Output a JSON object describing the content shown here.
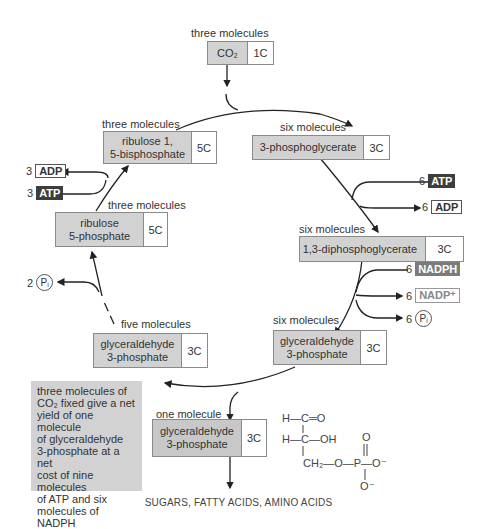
{
  "diagram": {
    "nodes": {
      "co2": {
        "count_label": "three molecules",
        "name": "CO₂",
        "carbons": "1C"
      },
      "pga": {
        "count_label": "six molecules",
        "name": "3-phosphoglycerate",
        "carbons": "3C"
      },
      "dpg": {
        "count_label": "six molecules",
        "name": "1,3-diphosphoglycerate",
        "carbons": "3C"
      },
      "g3p_six": {
        "count_label": "six molecules",
        "name_line1": "glyceraldehyde",
        "name_line2": "3-phosphate",
        "carbons": "3C"
      },
      "g3p_five": {
        "count_label": "five molecules",
        "name_line1": "glyceraldehyde",
        "name_line2": "3-phosphate",
        "carbons": "3C"
      },
      "ru5p": {
        "count_label": "three molecules",
        "name_line1": "ribulose",
        "name_line2": "5-phosphate",
        "carbons": "5C"
      },
      "rubp": {
        "count_label": "three molecules",
        "name_line1": "ribulose 1,",
        "name_line2": "5-bisphosphate",
        "carbons": "5C"
      },
      "g3p_one": {
        "count_label": "one molecule",
        "name_line1": "glyceraldehyde",
        "name_line2": "3-phosphate",
        "carbons": "3C"
      }
    },
    "cofactors": {
      "atp_in_right": {
        "count": "6",
        "label": "ATP"
      },
      "adp_out_right": {
        "count": "6",
        "label": "ADP"
      },
      "nadph_in": {
        "count": "6",
        "label": "NADPH"
      },
      "nadp_out": {
        "count": "6",
        "label": "NADP⁺"
      },
      "pi_out_right": {
        "count": "6",
        "label": "Pᵢ"
      },
      "adp_out_left": {
        "count": "3",
        "label": "ADP"
      },
      "atp_in_left": {
        "count": "3",
        "label": "ATP"
      },
      "pi_out_left": {
        "count": "2",
        "label": "Pᵢ"
      }
    },
    "note": {
      "line1": "three molecules of",
      "line2": "CO₂ fixed give a net",
      "line3": "yield of one molecule",
      "line4": "of glyceraldehyde",
      "line5": "3-phosphate at a net",
      "line6": "cost of nine molecules",
      "line7": "of ATP and six",
      "line8": "molecules of NADPH"
    },
    "structure": {
      "row1": "H—C═O",
      "row2": "H—C—OH",
      "row3": "CH₂—O—P—O⁻",
      "p_top": "O",
      "p_bottom": "O⁻"
    },
    "footer": "SUGARS, FATTY ACIDS, AMINO ACIDS"
  }
}
